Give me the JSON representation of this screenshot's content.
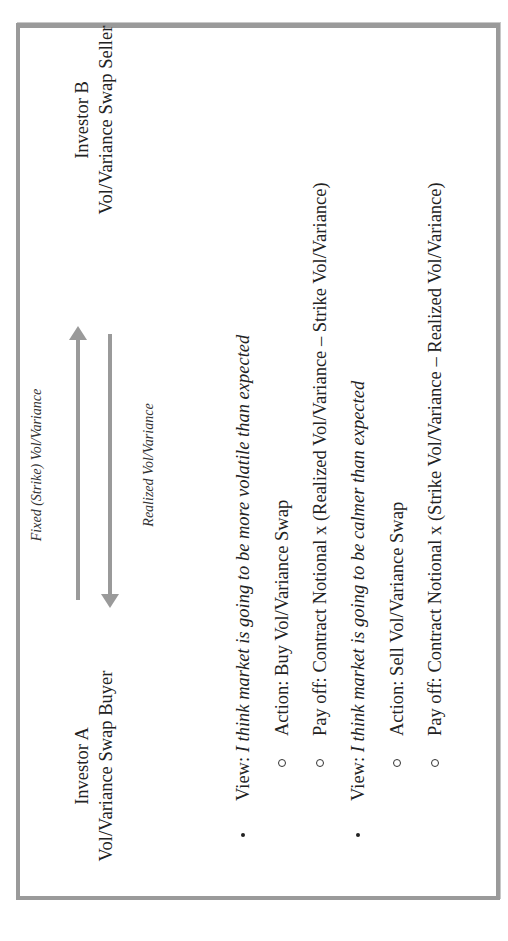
{
  "diagram": {
    "orientation": "rotated-90-ccw",
    "investor_a": {
      "name": "Investor A",
      "role": "Vol/Variance Swap Buyer"
    },
    "investor_b": {
      "name": "Investor B",
      "role": "Vol/Variance Swap Seller"
    },
    "arrows": [
      {
        "label": "Fixed (Strike) Vol/Variance",
        "direction": "A-to-B",
        "color": "#9a9a9a"
      },
      {
        "label": "Realized Vol/Variance",
        "direction": "B-to-A",
        "color": "#9a9a9a"
      }
    ],
    "scenarios": [
      {
        "view_prefix": "View: ",
        "view_text": "I think market is going to be more volatile than expected",
        "action": "Action: Buy Vol/Variance Swap",
        "payoff": "Pay off: Contract Notional x (Realized Vol/Variance – Strike Vol/Variance)"
      },
      {
        "view_prefix": "View: ",
        "view_text": "I think market is going to be calmer than expected",
        "action": "Action: Sell Vol/Variance Swap",
        "payoff": "Pay off: Contract Notional x (Strike Vol/Variance – Realized Vol/Variance)"
      }
    ],
    "colors": {
      "border": "#9a9a9a",
      "arrow": "#9a9a9a",
      "text": "#222222",
      "background": "#ffffff"
    }
  }
}
